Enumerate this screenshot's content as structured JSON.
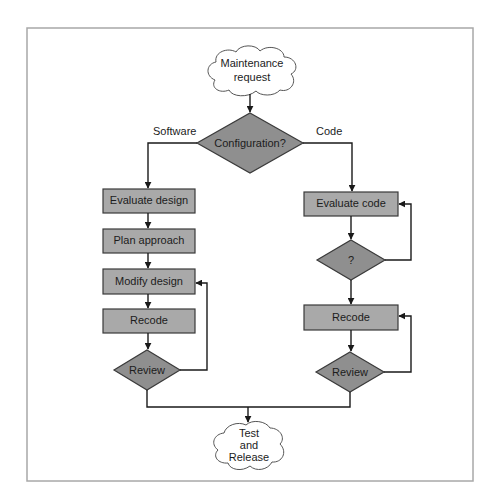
{
  "diagram": {
    "type": "flowchart",
    "start": {
      "label_line1": "Maintenance",
      "label_line2": "request"
    },
    "decision": {
      "label": "Configuration?"
    },
    "branches": {
      "left": {
        "label": "Software"
      },
      "right": {
        "label": "Code"
      }
    },
    "software_steps": [
      {
        "label": "Evaluate design"
      },
      {
        "label": "Plan approach"
      },
      {
        "label": "Modify design"
      },
      {
        "label": "Recode"
      }
    ],
    "software_review": {
      "label": "Review"
    },
    "code_steps": {
      "evaluate": {
        "label": "Evaluate code"
      },
      "check": {
        "label": "?"
      },
      "recode": {
        "label": "Recode"
      },
      "review": {
        "label": "Review"
      }
    },
    "end": {
      "label_line1": "Test",
      "label_line2": "and",
      "label_line3": "Release"
    },
    "colors": {
      "process_fill": "#a9a9a9",
      "decision_fill": "#8f8f8f",
      "terminal_fill": "#ffffff",
      "line": "#1a1a1a"
    }
  }
}
